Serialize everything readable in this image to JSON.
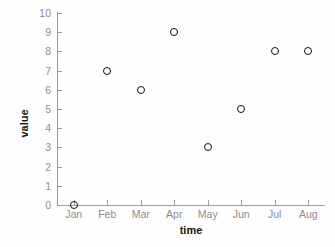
{
  "chart_data": {
    "type": "scatter",
    "title": "",
    "xlabel": "time",
    "ylabel": "value",
    "categories": [
      "Jan",
      "Feb",
      "Mar",
      "Apr",
      "May",
      "Jun",
      "Jul",
      "Aug"
    ],
    "values": [
      0,
      7,
      6,
      9,
      3,
      5,
      8,
      8
    ],
    "series": [
      {
        "name": "value",
        "values": [
          0,
          7,
          6,
          9,
          3,
          5,
          8,
          8
        ]
      }
    ],
    "points": [
      {
        "x": "Jan",
        "y": 0
      },
      {
        "x": "Feb",
        "y": 7
      },
      {
        "x": "Mar",
        "y": 6
      },
      {
        "x": "Apr",
        "y": 9
      },
      {
        "x": "May",
        "y": 3
      },
      {
        "x": "Jun",
        "y": 5
      },
      {
        "x": "Jul",
        "y": 8
      },
      {
        "x": "Aug",
        "y": 8
      }
    ],
    "ylim": [
      0,
      10
    ],
    "ytick_labels": [
      "0",
      "1",
      "2",
      "3",
      "4",
      "5",
      "6",
      "7",
      "8",
      "9",
      "10"
    ],
    "ytick_values": [
      0,
      1,
      2,
      3,
      4,
      5,
      6,
      7,
      8,
      9,
      10
    ],
    "xtick_labels": [
      "Jan",
      "Feb",
      "Mar",
      "Apr",
      "May",
      "Jun",
      "Jul",
      "Aug"
    ],
    "grid": false,
    "legend": "none",
    "marker_style": "open-circle",
    "colors": {
      "marker_stroke": "#111111",
      "axis": "#9a9a9a",
      "tick_label": "#8d8d8d",
      "axis_title": "#161616",
      "background": "#fefefe"
    }
  }
}
